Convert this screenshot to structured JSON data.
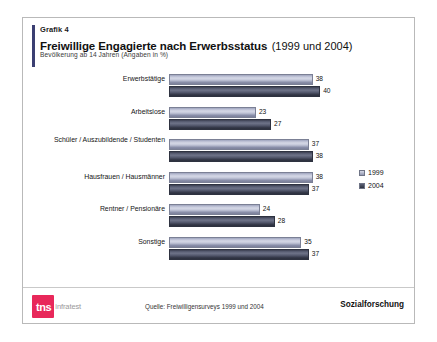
{
  "header": {
    "grafik_label": "Grafik 4",
    "title_main": "Freiwillige Engagierte nach Erwerbsstatus",
    "title_years": "(1999 und 2004)",
    "subtitle": "Bevölkerung ab 14 Jahren (Angaben in %)"
  },
  "footer": {
    "logo_mark": "tns",
    "logo_word": "infratest",
    "source": "Quelle: Freiwilligensurveys 1999 und 2004",
    "department": "Sozialforschung"
  },
  "legend": {
    "items": [
      {
        "label": "1999",
        "color": "#c3c7d9"
      },
      {
        "label": "2004",
        "color": "#3b3f50"
      }
    ]
  },
  "chart_data": {
    "type": "bar",
    "orientation": "horizontal",
    "title": "Freiwillige Engagierte nach Erwerbsstatus (1999 und 2004)",
    "subtitle": "Bevölkerung ab 14 Jahren (Angaben in %)",
    "xlabel": "",
    "ylabel": "",
    "unit": "%",
    "xlim": [
      0,
      45
    ],
    "grid": false,
    "legend_position": "right",
    "categories": [
      "Erwerbstätige",
      "Arbeitslose",
      "Schüler / Auszubildende / Studenten",
      "Hausfrauen / Hausmänner",
      "Rentner / Pensionäre",
      "Sonstige"
    ],
    "series": [
      {
        "name": "1999",
        "color": "#c3c7d9",
        "values": [
          38,
          23,
          37,
          38,
          24,
          35
        ]
      },
      {
        "name": "2004",
        "color": "#3b3f50",
        "values": [
          40,
          27,
          38,
          37,
          28,
          37
        ]
      }
    ]
  }
}
